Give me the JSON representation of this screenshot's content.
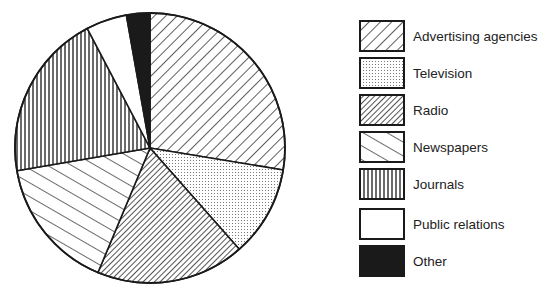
{
  "chart_data": {
    "type": "pie",
    "title": "",
    "categories": [
      "Advertising agencies",
      "Television",
      "Radio",
      "Newspapers",
      "Journals",
      "Public relations",
      "Other"
    ],
    "values": [
      27.6,
      10.9,
      17.8,
      16.0,
      20.0,
      4.9,
      2.8
    ],
    "unit": "percent (estimated from slice angles)",
    "start_angle_deg": 0,
    "direction": "clockwise from 12 o'clock",
    "legend_position": "right",
    "patterns": [
      "wide diagonal hatch (/)",
      "dotted stipple",
      "dense diagonal hatch (/)",
      "wide diagonal hatch (\\)",
      "vertical lines",
      "blank/white",
      "solid black"
    ]
  },
  "legend": {
    "items": [
      {
        "label": "Advertising agencies",
        "pattern": "hatch-wide"
      },
      {
        "label": "Television",
        "pattern": "dots"
      },
      {
        "label": "Radio",
        "pattern": "hatch-dense"
      },
      {
        "label": "Newspapers",
        "pattern": "hatch-back"
      },
      {
        "label": "Journals",
        "pattern": "vertical"
      },
      {
        "label": "Public relations",
        "pattern": "blank"
      },
      {
        "label": "Other",
        "pattern": "solid"
      }
    ]
  },
  "colors": {
    "ink": "#1a1a1a",
    "background": "#ffffff"
  }
}
